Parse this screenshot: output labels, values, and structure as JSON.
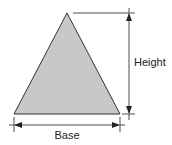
{
  "diagram": {
    "labels": {
      "height": "Height",
      "base": "Base"
    },
    "colors": {
      "fill": "#c8c8c8",
      "stroke": "#333333",
      "text": "#222222"
    },
    "shape": {
      "type": "triangle",
      "apex": [
        67,
        13
      ],
      "base_left": [
        14,
        114
      ],
      "base_right": [
        120,
        114
      ]
    }
  }
}
